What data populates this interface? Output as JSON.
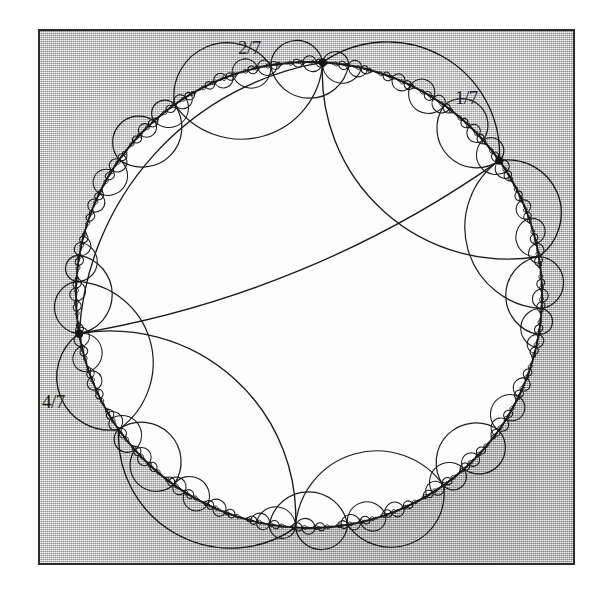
{
  "figure": {
    "name": "hyperbolic-lamination-poincare-disk",
    "background_color": "#ffffff",
    "plate_fill": "#b9b9b9",
    "plate_border_color": "#2b2b2b",
    "curve_color": "#1a1a1a",
    "disk_fill": "#ffffff"
  },
  "labels": [
    {
      "id": "label-2-7",
      "text": "2/7",
      "angle_turns": 0.2857142857
    },
    {
      "id": "label-1-7",
      "text": "1/7",
      "angle_turns": 0.1428571429
    },
    {
      "id": "label-4-7",
      "text": "4/7",
      "angle_turns": 0.5714285714
    }
  ],
  "chart_data": {
    "type": "scatter",
    "title": "",
    "subtitle": "",
    "xlabel": "",
    "ylabel": "",
    "grid": false,
    "legend": null,
    "disk": {
      "center_x": 309,
      "center_y": 295,
      "radius": 233,
      "boundary_stroke": "#1a1a1a"
    },
    "marked_points": [
      {
        "label": "1/7",
        "turns": 0.1428571429,
        "x": 455,
        "y": 117
      },
      {
        "label": "2/7",
        "turns": 0.2857142857,
        "x": 258,
        "y": 62
      },
      {
        "label": "4/7",
        "turns": 0.5714285714,
        "x": 95,
        "y": 400
      }
    ],
    "major_leaves": [
      {
        "a": 0.1428571429,
        "b": 0.2857142857
      },
      {
        "a": 0.2857142857,
        "b": 0.5714285714
      },
      {
        "a": 0.5714285714,
        "b": 0.1428571429
      }
    ],
    "annotations": [
      "2/7",
      "1/7",
      "4/7"
    ],
    "note": "Leaves are hyperbolic geodesics joining boundary angles; gaps are filled recursively by pullbacks under the doubling map."
  }
}
